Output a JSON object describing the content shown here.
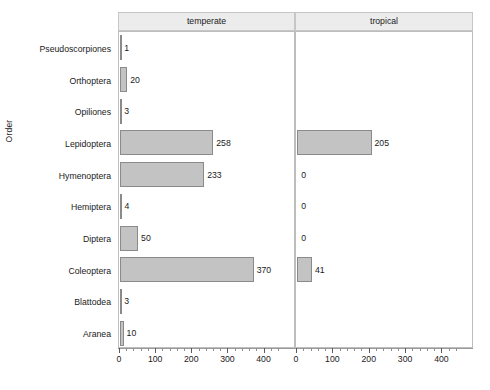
{
  "chart_data": {
    "type": "bar",
    "title": "",
    "subtitle": "",
    "orientation": "horizontal",
    "xlabel": "",
    "ylabel": "Order",
    "xlim": [
      0,
      440
    ],
    "xticks": [
      0,
      100,
      200,
      300,
      400
    ],
    "xtick_labels": [
      "0",
      "100",
      "200",
      "300",
      "400"
    ],
    "minor_tick_step": 20,
    "grid": false,
    "legend": "none",
    "facet_variable": "habitat",
    "facets": [
      "temperate",
      "tropical"
    ],
    "categories": [
      "Pseudoscorpiones",
      "Orthoptera",
      "Opiliones",
      "Lepidoptera",
      "Hymenoptera",
      "Hemiptera",
      "Diptera",
      "Coleoptera",
      "Blattodea",
      "Aranea"
    ],
    "series": [
      {
        "name": "temperate",
        "values": [
          1,
          20,
          3,
          258,
          233,
          4,
          50,
          370,
          3,
          10
        ],
        "labels": [
          "1",
          "20",
          "3",
          "258",
          "233",
          "4",
          "50",
          "370",
          "3",
          "10"
        ]
      },
      {
        "name": "tropical",
        "values": [
          null,
          null,
          null,
          205,
          0,
          0,
          0,
          41,
          null,
          null
        ],
        "labels": [
          "",
          "",
          "",
          "205",
          "0",
          "0",
          "0",
          "41",
          "",
          ""
        ]
      }
    ],
    "colors": {
      "bar_fill": "#c3c3c3",
      "bar_stroke": "#8a8a8a",
      "strip_background": "#ececec",
      "panel_border": "#bdbdbd",
      "text": "#1a1a1a",
      "background": "#ffffff"
    }
  },
  "panels": {
    "temperate": {
      "label": "temperate"
    },
    "tropical": {
      "label": "tropical"
    }
  },
  "axes": {
    "y_title": "Order",
    "x_tick_labels": [
      "0",
      "100",
      "200",
      "300",
      "400"
    ],
    "category_labels": [
      "Pseudoscorpiones",
      "Orthoptera",
      "Opiliones",
      "Lepidoptera",
      "Hymenoptera",
      "Hemiptera",
      "Diptera",
      "Coleoptera",
      "Blattodea",
      "Aranea"
    ]
  }
}
